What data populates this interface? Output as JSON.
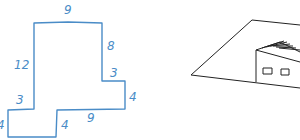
{
  "floor_plan": {
    "stroke_color": "#4a8cc7",
    "labels": {
      "top": "9",
      "right_upper": "8",
      "left_upper": "12",
      "step_top": "3",
      "right_lower": "4",
      "left_step": "3",
      "bottom_right": "9",
      "inner_vertical": "4",
      "far_left": "4"
    }
  },
  "perspective_sketch": {
    "stroke_color": "#222222",
    "windows": 2
  }
}
